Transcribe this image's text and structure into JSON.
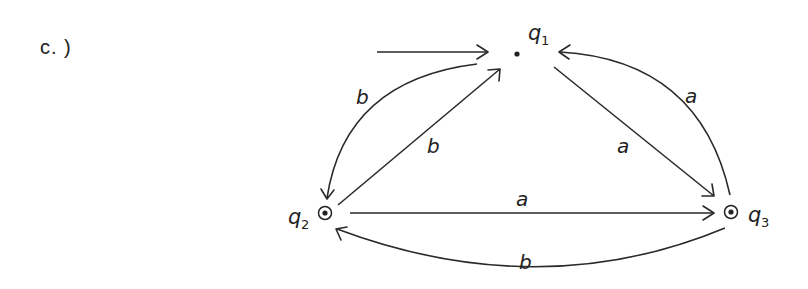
{
  "part_label": "c. )",
  "automaton": {
    "states": [
      {
        "id": "q1",
        "name": "q",
        "subscript": "1",
        "initial": true,
        "accepting": false
      },
      {
        "id": "q2",
        "name": "q",
        "subscript": "2",
        "initial": false,
        "accepting": true
      },
      {
        "id": "q3",
        "name": "q",
        "subscript": "3",
        "initial": false,
        "accepting": true
      }
    ],
    "transitions": [
      {
        "from": "q1",
        "to": "q2",
        "symbol": "b"
      },
      {
        "from": "q2",
        "to": "q1",
        "symbol": "b"
      },
      {
        "from": "q1",
        "to": "q3",
        "symbol": "a"
      },
      {
        "from": "q3",
        "to": "q1",
        "symbol": "a"
      },
      {
        "from": "q2",
        "to": "q3",
        "symbol": "a"
      },
      {
        "from": "q3",
        "to": "q2",
        "symbol": "b"
      }
    ]
  },
  "labels": {
    "q1_name": "q",
    "q1_sub": "1",
    "q2_name": "q",
    "q2_sub": "2",
    "q3_name": "q",
    "q3_sub": "3",
    "edge_q1_q2": "b",
    "edge_q2_q1": "b",
    "edge_q1_q3": "a",
    "edge_q3_q1": "a",
    "edge_q2_q3": "a",
    "edge_q3_q2": "b"
  },
  "colors": {
    "ink": "#2a2a2a",
    "background": "#ffffff"
  }
}
